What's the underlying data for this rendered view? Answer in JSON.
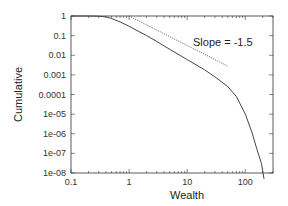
{
  "chart_data": {
    "type": "line",
    "title": "",
    "xlabel": "Wealth",
    "ylabel": "Cumulative",
    "xscale": "log",
    "yscale": "log",
    "xlim": [
      0.1,
      300
    ],
    "ylim": [
      1e-08,
      1
    ],
    "x_ticks": [
      "0.1",
      "1",
      "10",
      "100"
    ],
    "y_ticks": [
      "1",
      "0.1",
      "0.01",
      "0.001",
      "0.0001",
      "1e-05",
      "1e-06",
      "1e-07",
      "1e-08"
    ],
    "grid": false,
    "legend": null,
    "annotations": [
      {
        "text": "Slope = -1.5",
        "x": 20,
        "y": 0.1
      }
    ],
    "series": [
      {
        "name": "cumulative distribution",
        "style": "solid",
        "x": [
          0.1,
          0.2,
          0.3,
          0.4,
          0.5,
          0.7,
          1,
          2,
          3,
          5,
          10,
          20,
          30,
          50,
          70,
          100,
          130,
          160,
          190,
          210
        ],
        "y": [
          1,
          1,
          0.98,
          0.9,
          0.75,
          0.5,
          0.3,
          0.1,
          0.05,
          0.02,
          0.006,
          0.0018,
          0.0008,
          0.00025,
          8e-05,
          1e-05,
          1.2e-06,
          1.5e-07,
          3e-08,
          5e-09
        ]
      },
      {
        "name": "Slope = -1.5 reference",
        "style": "dotted",
        "x": [
          1,
          50
        ],
        "y": [
          1,
          0.0028
        ]
      }
    ]
  }
}
